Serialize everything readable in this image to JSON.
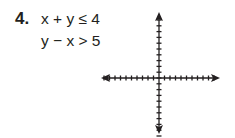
{
  "problem": {
    "number": "4.",
    "inequalities": [
      "x + y ≤ 4",
      "y − x > 5"
    ]
  },
  "graph": {
    "type": "blank-coordinate-plane",
    "ticks_per_half_axis": 10,
    "axis_color": "#231f20",
    "arrows": [
      "left",
      "right",
      "up",
      "down"
    ]
  }
}
